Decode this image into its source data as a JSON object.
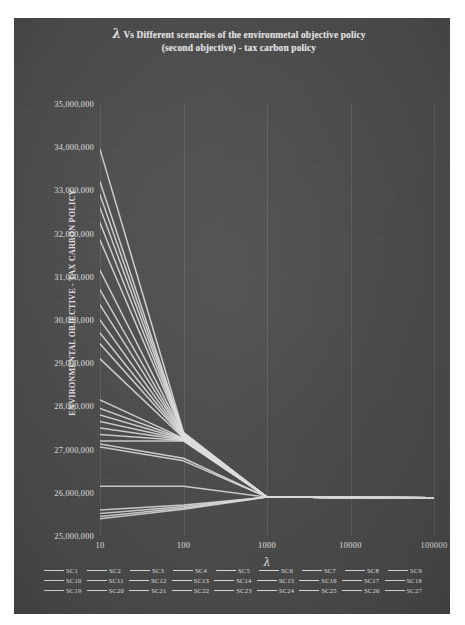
{
  "chart_data": {
    "type": "line",
    "title": "λ Vs Different scenarios of the environmetal objective policy (second objective) - tax carbon policy",
    "title_lines": [
      "Vs Different scenarios of the environmetal",
      "objective policy (second objective) - tax carbon",
      "policy"
    ],
    "title_lambda": "λ",
    "xlabel": "λ",
    "ylabel": "ENVIRONMENTAL OBJECTIVE - TAX CARBON POLICY",
    "x_scale": "log",
    "x": [
      10,
      100,
      1000,
      10000,
      100000
    ],
    "xticklabels": [
      "10",
      "100",
      "1000",
      "10000",
      "100000"
    ],
    "ylim": [
      25000000,
      35000000
    ],
    "yticks": [
      25000000,
      26000000,
      27000000,
      28000000,
      29000000,
      30000000,
      31000000,
      32000000,
      33000000,
      34000000,
      35000000
    ],
    "yticklabels": [
      "25,000,000",
      "26,000,000",
      "27,000,000",
      "28,000,000",
      "29,000,000",
      "30,000,000",
      "31,000,000",
      "32,000,000",
      "33,000,000",
      "34,000,000",
      "35,000,000"
    ],
    "grid": true,
    "legend_position": "bottom",
    "background_color": "#4e4e4e",
    "line_color": "#e8e8e8",
    "series": [
      {
        "name": "SC1",
        "values": [
          33950000,
          27400000,
          25900000,
          25890000,
          25885000
        ]
      },
      {
        "name": "SC2",
        "values": [
          33200000,
          27380000,
          25900000,
          25890000,
          25885000
        ]
      },
      {
        "name": "SC3",
        "values": [
          32900000,
          27370000,
          25900000,
          25890000,
          25885000
        ]
      },
      {
        "name": "SC4",
        "values": [
          32600000,
          27360000,
          25900000,
          25890000,
          25885000
        ]
      },
      {
        "name": "SC5",
        "values": [
          32250000,
          27350000,
          25900000,
          25890000,
          25885000
        ]
      },
      {
        "name": "SC6",
        "values": [
          31850000,
          27340000,
          25900000,
          25890000,
          25885000
        ]
      },
      {
        "name": "SC7",
        "values": [
          31150000,
          27330000,
          25900000,
          25890000,
          25885000
        ]
      },
      {
        "name": "SC8",
        "values": [
          30700000,
          27320000,
          25900000,
          25890000,
          25885000
        ]
      },
      {
        "name": "SC9",
        "values": [
          30350000,
          27310000,
          25900000,
          25890000,
          25885000
        ]
      },
      {
        "name": "SC10",
        "values": [
          30000000,
          27300000,
          25900000,
          25890000,
          25885000
        ]
      },
      {
        "name": "SC11",
        "values": [
          29700000,
          27290000,
          25900000,
          25890000,
          25885000
        ]
      },
      {
        "name": "SC12",
        "values": [
          29450000,
          27280000,
          25900000,
          25890000,
          25885000
        ]
      },
      {
        "name": "SC13",
        "values": [
          29100000,
          27270000,
          25900000,
          25890000,
          25885000
        ]
      },
      {
        "name": "SC14",
        "values": [
          28150000,
          27260000,
          25900000,
          25890000,
          25885000
        ]
      },
      {
        "name": "SC15",
        "values": [
          27950000,
          27250000,
          25900000,
          25890000,
          25885000
        ]
      },
      {
        "name": "SC16",
        "values": [
          27800000,
          27240000,
          25900000,
          25890000,
          25885000
        ]
      },
      {
        "name": "SC17",
        "values": [
          27650000,
          27230000,
          25900000,
          25890000,
          25885000
        ]
      },
      {
        "name": "SC18",
        "values": [
          27500000,
          27220000,
          25900000,
          25890000,
          25885000
        ]
      },
      {
        "name": "SC19",
        "values": [
          27350000,
          27210000,
          25900000,
          25890000,
          25885000
        ]
      },
      {
        "name": "SC20",
        "values": [
          27200000,
          27200000,
          25900000,
          25890000,
          25885000
        ]
      },
      {
        "name": "SC21",
        "values": [
          27130000,
          26800000,
          25900000,
          25890000,
          25885000
        ]
      },
      {
        "name": "SC22",
        "values": [
          27060000,
          26740000,
          25900000,
          25890000,
          25885000
        ]
      },
      {
        "name": "SC23",
        "values": [
          26150000,
          26150000,
          25900000,
          25890000,
          25885000
        ]
      },
      {
        "name": "SC24",
        "values": [
          25600000,
          25720000,
          25900000,
          25890000,
          25885000
        ]
      },
      {
        "name": "SC25",
        "values": [
          25520000,
          25680000,
          25900000,
          25890000,
          25885000
        ]
      },
      {
        "name": "SC26",
        "values": [
          25450000,
          25650000,
          25900000,
          25890000,
          25885000
        ]
      },
      {
        "name": "SC27",
        "values": [
          25400000,
          25620000,
          25900000,
          25890000,
          25885000
        ]
      }
    ]
  },
  "legend": {
    "rows": [
      [
        "SC1",
        "SC2",
        "SC3",
        "SC4",
        "SC5",
        "SC6",
        "SC7",
        "SC8",
        "SC9"
      ],
      [
        "SC10",
        "SC11",
        "SC12",
        "SC13",
        "SC14",
        "SC15",
        "SC16",
        "SC17",
        "SC18"
      ],
      [
        "SC19",
        "SC20",
        "SC21",
        "SC22",
        "SC23",
        "SC24",
        "SC25",
        "SC26",
        "SC27"
      ]
    ]
  }
}
